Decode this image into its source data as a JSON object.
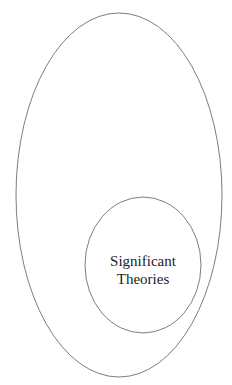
{
  "diagram": {
    "type": "nested-ellipses",
    "outer_ellipse": {
      "label": "",
      "cx": 119,
      "cy": 195,
      "rx": 103,
      "ry": 182,
      "stroke": "#6e6e6e"
    },
    "inner_ellipse": {
      "label_lines": [
        "Significant",
        "Theories"
      ],
      "cx": 143,
      "cy": 265,
      "rx": 58,
      "ry": 68,
      "stroke": "#6e6e6e"
    }
  }
}
